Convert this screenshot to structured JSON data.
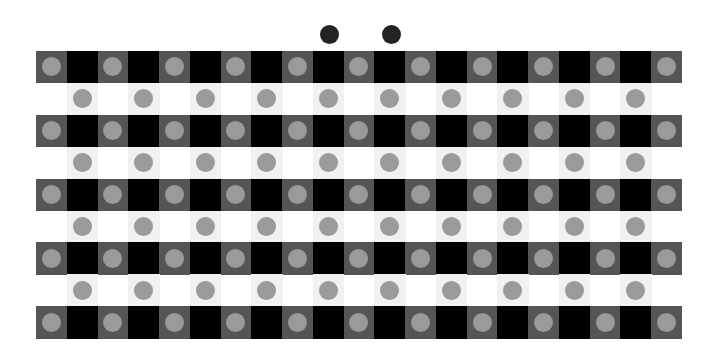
{
  "illusion": {
    "title": "",
    "grid": {
      "left": 36,
      "top": 51,
      "cols": 21,
      "rows": 9,
      "col_width": 30.76,
      "row_height": 31.9,
      "circle_diameter": 19
    },
    "colors": {
      "background": "#ffffff",
      "dark_cell": "#555555",
      "black_cell": "#000000",
      "light_cell": "#f1f1f1",
      "circle": "#9a9a9a",
      "top_dot": "#232323"
    },
    "top_dots": [
      {
        "x": 329,
        "y": 34,
        "d": 19
      },
      {
        "x": 391,
        "y": 34,
        "d": 19
      }
    ]
  }
}
